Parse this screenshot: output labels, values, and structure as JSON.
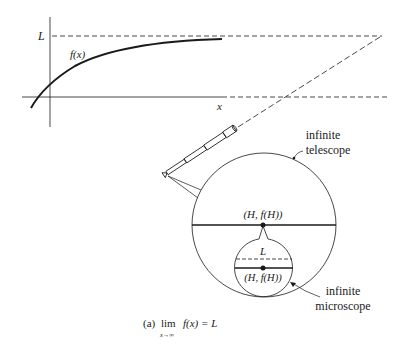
{
  "figure": {
    "caption_prefix": "(a)",
    "caption_lim": "lim",
    "caption_sub": "x→∞",
    "caption_expr": "f(x) = L"
  },
  "graph": {
    "limit_label": "L",
    "function_label": "f(x)",
    "x_axis_label": "x"
  },
  "telescope": {
    "label_line1": "infinite",
    "label_line2": "telescope",
    "point_label": "(H, f(H))"
  },
  "microscope": {
    "label_line1": "infinite",
    "label_line2": "microscope",
    "limit_label": "L",
    "point_label": "(H, f(H))"
  },
  "colors": {
    "ink": "#1a1a1a",
    "background": "#ffffff"
  }
}
